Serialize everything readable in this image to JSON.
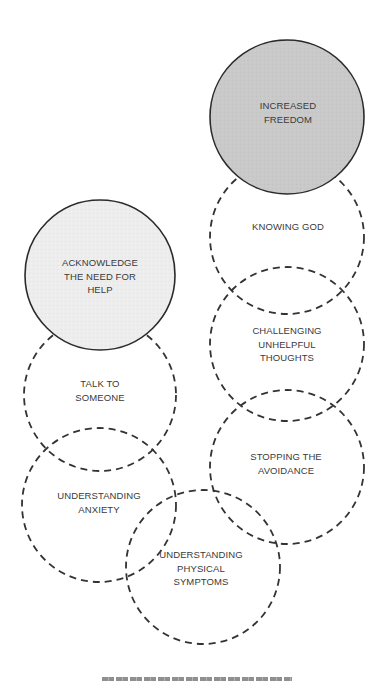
{
  "diagram": {
    "title": "",
    "colors": {
      "stroke": "#2b2b2b",
      "dashed_stroke": "#333333",
      "goal_fill": "#c9c9c9",
      "start_fill": "#ececec",
      "step_fill": "none",
      "text": "#3a3a3a"
    },
    "nodes": [
      {
        "id": "increased-freedom",
        "label": "INCREASED\nFREEDOM",
        "style": "solid",
        "fill": "goal",
        "cx": 287,
        "cy": 117,
        "r": 77
      },
      {
        "id": "knowing-god",
        "label": "KNOWING GOD",
        "style": "dashed",
        "fill": "none",
        "cx": 287,
        "cy": 237,
        "r": 77
      },
      {
        "id": "challenging-unhelpful-thoughts",
        "label": "CHALLENGING\nUNHELPFUL\nTHOUGHTS",
        "style": "dashed",
        "fill": "none",
        "cx": 287,
        "cy": 344,
        "r": 77
      },
      {
        "id": "stopping-the-avoidance",
        "label": "STOPPING THE\nAVOIDANCE",
        "style": "dashed",
        "fill": "none",
        "cx": 287,
        "cy": 467,
        "r": 77
      },
      {
        "id": "understanding-physical-symptoms",
        "label": "UNDERSTANDING\nPHYSICAL\nSYMPTOMS",
        "style": "dashed",
        "fill": "none",
        "cx": 203,
        "cy": 567,
        "r": 77
      },
      {
        "id": "understanding-anxiety",
        "label": "UNDERSTANDING\nANXIETY",
        "style": "dashed",
        "fill": "none",
        "cx": 99,
        "cy": 505,
        "r": 77
      },
      {
        "id": "talk-to-someone",
        "label": "TALK TO\nSOMEONE",
        "style": "dashed",
        "fill": "none",
        "cx": 100,
        "cy": 395,
        "r": 76
      },
      {
        "id": "acknowledge-the-need-for-help",
        "label": "ACKNOWLEDGE\nTHE NEED FOR\nHELP",
        "style": "solid",
        "fill": "start",
        "cx": 100,
        "cy": 275,
        "r": 75
      }
    ],
    "labels": [
      {
        "node": "increased-freedom",
        "text": "INCREASED\nFREEDOM",
        "x": 288,
        "y": 112
      },
      {
        "node": "knowing-god",
        "text": "KNOWING GOD",
        "x": 288,
        "y": 227
      },
      {
        "node": "challenging-unhelpful-thoughts",
        "text": "CHALLENGING\nUNHELPFUL\nTHOUGHTS",
        "x": 287,
        "y": 344
      },
      {
        "node": "stopping-the-avoidance",
        "text": "STOPPING THE\nAVOIDANCE",
        "x": 286,
        "y": 463
      },
      {
        "node": "understanding-physical-symptoms",
        "text": "UNDERSTANDING\nPHYSICAL\nSYMPTOMS",
        "x": 201,
        "y": 568
      },
      {
        "node": "understanding-anxiety",
        "text": "UNDERSTANDING\nANXIETY",
        "x": 99,
        "y": 502
      },
      {
        "node": "talk-to-someone",
        "text": "TALK TO\nSOMEONE",
        "x": 100,
        "y": 390
      },
      {
        "node": "acknowledge-the-need-for-help",
        "text": "ACKNOWLEDGE\nTHE NEED FOR\nHELP",
        "x": 100,
        "y": 276
      }
    ],
    "caption_partial": ""
  }
}
